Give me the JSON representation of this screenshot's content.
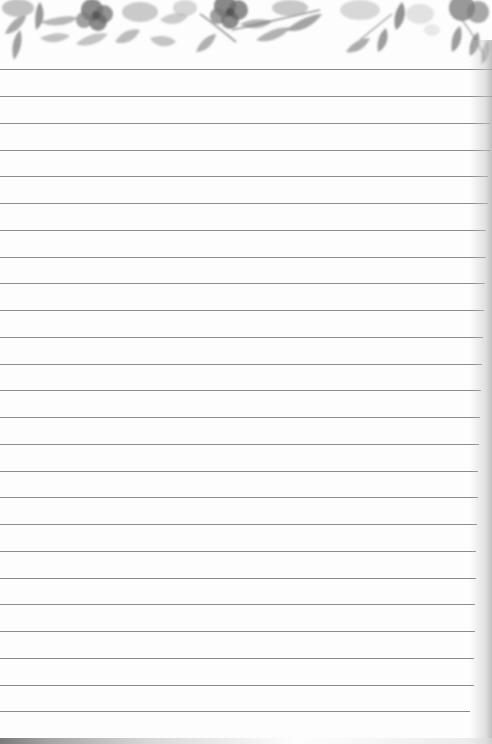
{
  "page": {
    "type": "lined-notepad-sheet",
    "background_color": "#fdfdfd",
    "header": {
      "style": "grayscale watercolor floral border",
      "height_px": 68,
      "elements": [
        "flowers",
        "leaves",
        "stems"
      ]
    },
    "ruled_lines": {
      "count": 25,
      "color": "#7e7e7e",
      "spacing_px": 26.75,
      "positions_y": [
        69,
        96,
        123,
        150,
        176,
        203,
        230,
        257,
        283,
        310,
        337,
        364,
        390,
        417,
        444,
        471,
        497,
        524,
        551,
        578,
        604,
        631,
        658,
        685,
        711
      ],
      "right_ends_x": [
        492,
        492,
        490,
        490,
        488,
        488,
        486,
        486,
        485,
        484,
        483,
        482,
        481,
        480,
        479,
        478,
        478,
        477,
        476,
        476,
        475,
        475,
        474,
        474,
        470
      ]
    },
    "content_text": ""
  }
}
